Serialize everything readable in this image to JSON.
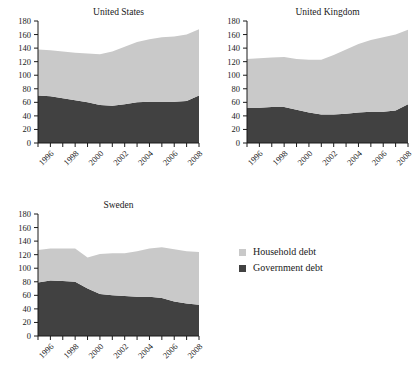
{
  "figure": {
    "background_color": "#ffffff",
    "household_color": "#c9c9c9",
    "government_color": "#414141"
  },
  "legend": {
    "position": "bottom-right",
    "items": [
      {
        "label": "Household debt",
        "color": "#c9c9c9"
      },
      {
        "label": "Government debt",
        "color": "#414141"
      }
    ]
  },
  "chart_data": [
    {
      "type": "area",
      "stacked": true,
      "title": "United States",
      "xlabel": "",
      "ylabel": "",
      "ylim": [
        0,
        180
      ],
      "xlim": [
        1995,
        2008
      ],
      "grid": false,
      "yticks": [
        0,
        20,
        40,
        60,
        80,
        100,
        120,
        140,
        160,
        180
      ],
      "xticks": [
        1996,
        1998,
        2000,
        2002,
        2004,
        2006,
        2008
      ],
      "x": [
        1995,
        1996,
        1997,
        1998,
        1999,
        2000,
        2001,
        2002,
        2003,
        2004,
        2005,
        2006,
        2007,
        2008
      ],
      "series": [
        {
          "name": "Government debt",
          "color": "#414141",
          "values": [
            70,
            69,
            66,
            63,
            60,
            56,
            55,
            57,
            60,
            61,
            61,
            61,
            62,
            70
          ]
        },
        {
          "name": "Household debt",
          "color": "#c9c9c9",
          "values": [
            68,
            68,
            69,
            70,
            72,
            75,
            80,
            85,
            89,
            92,
            95,
            96,
            98,
            98
          ]
        }
      ],
      "totals": [
        138,
        137,
        135,
        133,
        132,
        131,
        135,
        142,
        149,
        153,
        156,
        157,
        160,
        168
      ]
    },
    {
      "type": "area",
      "stacked": true,
      "title": "United Kingdom",
      "xlabel": "",
      "ylabel": "",
      "ylim": [
        0,
        180
      ],
      "xlim": [
        1995,
        2008
      ],
      "grid": false,
      "yticks": [
        0,
        20,
        40,
        60,
        80,
        100,
        120,
        140,
        160,
        180
      ],
      "xticks": [
        1996,
        1998,
        2000,
        2002,
        2004,
        2006,
        2008
      ],
      "x": [
        1995,
        1996,
        1997,
        1998,
        1999,
        2000,
        2001,
        2002,
        2003,
        2004,
        2005,
        2006,
        2007,
        2008
      ],
      "series": [
        {
          "name": "Government debt",
          "color": "#414141",
          "values": [
            52,
            52,
            53,
            53,
            49,
            45,
            42,
            42,
            43,
            45,
            46,
            46,
            48,
            57
          ]
        },
        {
          "name": "Household debt",
          "color": "#c9c9c9",
          "values": [
            72,
            73,
            73,
            74,
            75,
            78,
            81,
            88,
            95,
            101,
            106,
            110,
            112,
            110
          ]
        }
      ],
      "totals": [
        124,
        125,
        126,
        127,
        124,
        123,
        123,
        130,
        138,
        146,
        152,
        156,
        160,
        167
      ]
    },
    {
      "type": "area",
      "stacked": true,
      "title": "Sweden",
      "xlabel": "",
      "ylabel": "",
      "ylim": [
        0,
        180
      ],
      "xlim": [
        1995,
        2008
      ],
      "grid": false,
      "yticks": [
        0,
        20,
        40,
        60,
        80,
        100,
        120,
        140,
        160,
        180
      ],
      "xticks": [
        1996,
        1998,
        2000,
        2002,
        2004,
        2006,
        2008
      ],
      "x": [
        1995,
        1996,
        1997,
        1998,
        1999,
        2000,
        2001,
        2002,
        2003,
        2004,
        2005,
        2006,
        2007,
        2008
      ],
      "series": [
        {
          "name": "Government debt",
          "color": "#414141",
          "values": [
            79,
            82,
            81,
            80,
            70,
            62,
            60,
            59,
            58,
            58,
            56,
            51,
            48,
            46
          ]
        },
        {
          "name": "Household debt",
          "color": "#c9c9c9",
          "values": [
            48,
            47,
            48,
            49,
            46,
            59,
            62,
            63,
            67,
            71,
            75,
            77,
            77,
            78
          ]
        }
      ],
      "totals": [
        127,
        129,
        129,
        129,
        116,
        121,
        122,
        122,
        125,
        129,
        131,
        128,
        125,
        124
      ]
    }
  ]
}
